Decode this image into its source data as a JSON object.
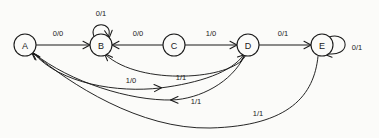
{
  "diagram": {
    "type": "finite-state-machine",
    "title": "",
    "canvas": {
      "width": 379,
      "height": 138
    },
    "colors": {
      "stroke": "#1a1a1a",
      "background": "#fbfbf9",
      "node_fill": "#fbfbf9"
    },
    "notation": "input/output",
    "states": [
      {
        "id": "A",
        "label": "A",
        "cx": 25,
        "cy": 45,
        "r": 11
      },
      {
        "id": "B",
        "label": "B",
        "cx": 101,
        "cy": 45,
        "r": 11
      },
      {
        "id": "C",
        "label": "C",
        "cx": 174,
        "cy": 45,
        "r": 11
      },
      {
        "id": "D",
        "label": "D",
        "cx": 248,
        "cy": 45,
        "r": 11
      },
      {
        "id": "E",
        "label": "E",
        "cx": 322,
        "cy": 45,
        "r": 11
      }
    ],
    "transitions": [
      {
        "id": "a-b",
        "from": "A",
        "to": "B",
        "label": "0/0",
        "label_x": 58,
        "label_y": 33,
        "kind": "straight"
      },
      {
        "id": "b-b",
        "from": "B",
        "to": "B",
        "label": "0/1",
        "label_x": 101,
        "label_y": 13,
        "kind": "self-loop-top"
      },
      {
        "id": "c-b",
        "from": "C",
        "to": "B",
        "label": "0/0",
        "label_x": 138,
        "label_y": 33,
        "kind": "straight"
      },
      {
        "id": "c-d",
        "from": "C",
        "to": "D",
        "label": "1/0",
        "label_x": 211,
        "label_y": 33,
        "kind": "straight"
      },
      {
        "id": "d-e",
        "from": "D",
        "to": "E",
        "label": "0/1",
        "label_x": 283,
        "label_y": 33,
        "kind": "straight"
      },
      {
        "id": "e-e",
        "from": "E",
        "to": "E",
        "label": "0/1",
        "label_x": 357,
        "label_y": 47,
        "kind": "self-loop-right"
      },
      {
        "id": "d-b",
        "from": "D",
        "to": "B",
        "label": "1/1",
        "label_x": 181,
        "label_y": 77,
        "kind": "curve-upper"
      },
      {
        "id": "a-d1",
        "from": "A",
        "to": "D",
        "label": "1/0",
        "label_x": 131,
        "label_y": 80,
        "kind": "curve-lower-right"
      },
      {
        "id": "d-a",
        "from": "D",
        "to": "A",
        "label": "1/1",
        "label_x": 196,
        "label_y": 101,
        "kind": "curve-lower-left"
      },
      {
        "id": "e-a",
        "from": "E",
        "to": "A",
        "label": "1/1",
        "label_x": 258,
        "label_y": 113,
        "kind": "curve-bottom"
      }
    ]
  }
}
